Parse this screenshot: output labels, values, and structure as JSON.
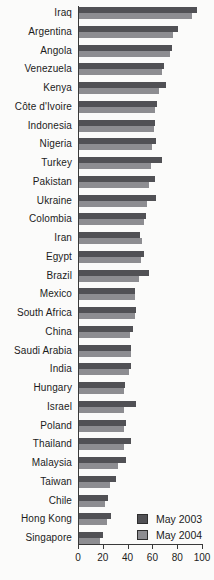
{
  "colors": {
    "background": "#fbfbfa",
    "axis": "#3a3a3a",
    "text": "#1c1c1c",
    "series_2003": "#515155",
    "series_2004": "#8d8d91"
  },
  "legend": {
    "items": [
      {
        "label": "May 2003",
        "color": "#515155"
      },
      {
        "label": "May 2004",
        "color": "#8d8d91"
      }
    ]
  },
  "chart_data": {
    "type": "bar",
    "orientation": "horizontal",
    "title": "",
    "xlabel": "",
    "ylabel": "",
    "xlim": [
      0,
      100
    ],
    "x_ticks": [
      0,
      20,
      40,
      60,
      80,
      100
    ],
    "grid": false,
    "legend_position": "bottom-right",
    "categories": [
      "Iraq",
      "Argentina",
      "Angola",
      "Venezuela",
      "Kenya",
      "Côte d'Ivoire",
      "Indonesia",
      "Nigeria",
      "Turkey",
      "Pakistan",
      "Ukraine",
      "Colombia",
      "Iran",
      "Egypt",
      "Brazil",
      "Mexico",
      "South Africa",
      "China",
      "Saudi Arabia",
      "India",
      "Hungary",
      "Israel",
      "Poland",
      "Thailand",
      "Malaysia",
      "Taiwan",
      "Chile",
      "Hong Kong",
      "Singapore"
    ],
    "series": [
      {
        "name": "May 2003",
        "color": "#515155",
        "values": [
          96,
          81,
          76,
          69,
          71,
          64,
          62,
          63,
          68,
          62,
          63,
          55,
          50,
          53,
          57,
          46,
          47,
          44,
          43,
          43,
          38,
          47,
          39,
          43,
          39,
          31,
          24,
          27,
          20
        ]
      },
      {
        "name": "May 2004",
        "color": "#8d8d91",
        "values": [
          92,
          77,
          74,
          68,
          65,
          62,
          61,
          60,
          59,
          57,
          56,
          53,
          52,
          51,
          49,
          46,
          46,
          42,
          43,
          41,
          37,
          37,
          37,
          37,
          32,
          26,
          22,
          23,
          18
        ]
      }
    ]
  }
}
